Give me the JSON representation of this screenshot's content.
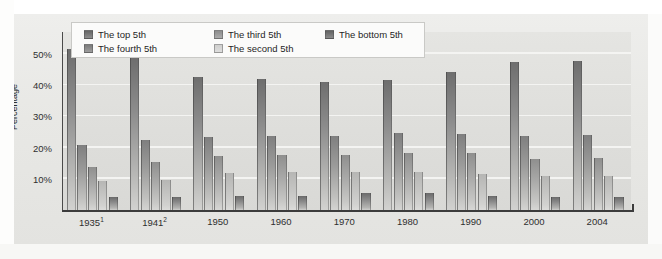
{
  "chart_data": {
    "type": "bar",
    "title": "",
    "xlabel": "",
    "ylabel": "Percentage",
    "ylim": [
      0,
      57
    ],
    "yticks": [
      10,
      20,
      30,
      40,
      50
    ],
    "ytick_labels": [
      "10%",
      "20%",
      "30%",
      "40%",
      "50%"
    ],
    "grid": true,
    "legend_position": "top-left inside plot",
    "categories": [
      "1935¹",
      "1941²",
      "1950",
      "1960",
      "1970",
      "1980",
      "1990",
      "2000",
      "2004"
    ],
    "category_labels": [
      {
        "text": "1935",
        "superscript": "1"
      },
      {
        "text": "1941",
        "superscript": "2"
      },
      {
        "text": "1950",
        "superscript": ""
      },
      {
        "text": "1960",
        "superscript": ""
      },
      {
        "text": "1970",
        "superscript": ""
      },
      {
        "text": "1980",
        "superscript": ""
      },
      {
        "text": "1990",
        "superscript": ""
      },
      {
        "text": "2000",
        "superscript": ""
      },
      {
        "text": "2004",
        "superscript": ""
      }
    ],
    "series": [
      {
        "name": "The top 5th",
        "color": "#6e6e6e",
        "values": [
          51.7,
          48.8,
          42.7,
          42.0,
          40.9,
          41.5,
          44.3,
          47.4,
          47.6
        ]
      },
      {
        "name": "The fourth 5th",
        "color": "#7f7f7f",
        "values": [
          20.9,
          22.3,
          23.5,
          23.6,
          23.8,
          24.8,
          24.2,
          23.8,
          24.1
        ]
      },
      {
        "name": "The third 5th",
        "color": "#8f8f8e",
        "values": [
          13.8,
          15.3,
          17.3,
          17.6,
          17.6,
          18.1,
          18.3,
          16.3,
          16.5
        ]
      },
      {
        "name": "The second 5th",
        "color": "#b6b6b4",
        "values": [
          9.2,
          9.5,
          12.0,
          12.2,
          12.2,
          12.2,
          11.4,
          10.8,
          10.8
        ]
      },
      {
        "name": "The bottom 5th",
        "color": "#6a6a6a",
        "values": [
          4.1,
          4.1,
          4.5,
          4.6,
          5.4,
          5.3,
          4.6,
          4.3,
          4.1
        ]
      }
    ]
  },
  "legend": {
    "items": [
      {
        "label": "The top 5th",
        "col": 0,
        "row": 0
      },
      {
        "label": "The fourth 5th",
        "col": 0,
        "row": 1
      },
      {
        "label": "The third 5th",
        "col": 1,
        "row": 0
      },
      {
        "label": "The second 5th",
        "col": 1,
        "row": 1
      },
      {
        "label": "The bottom 5th",
        "col": 2,
        "row": 0
      }
    ]
  },
  "axes": {
    "y_title": "Percentage"
  },
  "page_bleed": {
    "lines": [
      "the Income of Americans",
      "Historical Distribution of",
      "Distribution of",
      "Property and",
      "Income"
    ]
  },
  "colors": {
    "plot_background": "#e1e1de",
    "chart_background": "#e8e8e5",
    "gridline": "#f4f4f2",
    "axis": "#3c3c3c",
    "text": "#2f2f2f",
    "legend_background": "#fbfbfa"
  }
}
